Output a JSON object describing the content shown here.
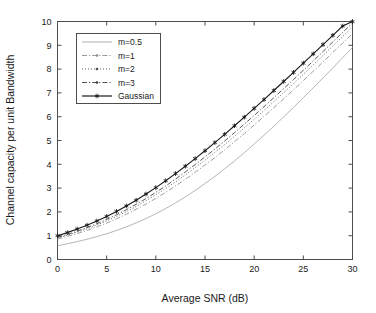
{
  "chart_data": {
    "type": "line",
    "title": "",
    "xlabel": "Average SNR (dB)",
    "ylabel": "Channel capacity per unit Bandwidth",
    "xlim": [
      0,
      30
    ],
    "ylim": [
      0,
      10
    ],
    "xticks": [
      0,
      5,
      10,
      15,
      20,
      25,
      30
    ],
    "yticks": [
      0,
      1,
      2,
      3,
      4,
      5,
      6,
      7,
      8,
      9,
      10
    ],
    "xtick_labels": [
      "0",
      "5",
      "10",
      "15",
      "20",
      "25",
      "30"
    ],
    "ytick_labels": [
      "0",
      "1",
      "2",
      "3",
      "4",
      "5",
      "6",
      "7",
      "8",
      "9",
      "10"
    ],
    "grid": false,
    "legend_position": "upper-left",
    "x": [
      0,
      1,
      2,
      3,
      4,
      5,
      6,
      7,
      8,
      9,
      10,
      11,
      12,
      13,
      14,
      15,
      16,
      17,
      18,
      19,
      20,
      21,
      22,
      23,
      24,
      25,
      26,
      27,
      28,
      29,
      30
    ],
    "series": [
      {
        "name": "m=0.5",
        "style": "solid",
        "color": "#a8a8a8",
        "marker": "none",
        "values": [
          0.58,
          0.66,
          0.75,
          0.85,
          0.96,
          1.08,
          1.22,
          1.37,
          1.54,
          1.72,
          1.92,
          2.14,
          2.38,
          2.63,
          2.9,
          3.19,
          3.49,
          3.81,
          4.14,
          4.49,
          4.85,
          5.22,
          5.6,
          5.99,
          6.39,
          6.8,
          7.21,
          7.63,
          8.05,
          8.48,
          8.91
        ]
      },
      {
        "name": "m=1",
        "style": "dashdot",
        "color": "#8c8c8c",
        "marker": "dot",
        "values": [
          0.86,
          0.97,
          1.09,
          1.22,
          1.37,
          1.53,
          1.71,
          1.9,
          2.11,
          2.33,
          2.57,
          2.82,
          3.09,
          3.37,
          3.66,
          3.97,
          4.28,
          4.61,
          4.95,
          5.29,
          5.65,
          6.01,
          6.38,
          6.75,
          7.13,
          7.52,
          7.91,
          8.3,
          8.7,
          9.09,
          9.49
        ]
      },
      {
        "name": "m=2",
        "style": "dotted",
        "color": "#4d4d4d",
        "marker": "dot",
        "values": [
          0.9,
          1.02,
          1.15,
          1.29,
          1.45,
          1.62,
          1.81,
          2.01,
          2.23,
          2.47,
          2.72,
          2.98,
          3.26,
          3.55,
          3.86,
          4.17,
          4.5,
          4.83,
          5.18,
          5.53,
          5.89,
          6.26,
          6.63,
          7.01,
          7.39,
          7.78,
          8.17,
          8.57,
          8.97,
          9.37,
          9.77
        ]
      },
      {
        "name": "m=3",
        "style": "dashdot",
        "color": "#3d3d3d",
        "marker": "dot",
        "values": [
          0.93,
          1.05,
          1.19,
          1.34,
          1.5,
          1.68,
          1.88,
          2.09,
          2.32,
          2.56,
          2.82,
          3.09,
          3.38,
          3.68,
          3.99,
          4.31,
          4.64,
          4.98,
          5.33,
          5.69,
          6.05,
          6.42,
          6.8,
          7.18,
          7.56,
          7.95,
          8.34,
          8.74,
          9.14,
          9.54,
          9.94
        ]
      },
      {
        "name": "Gaussian",
        "style": "solid",
        "color": "#1a1a1a",
        "marker": "star",
        "values": [
          1.0,
          1.13,
          1.28,
          1.44,
          1.62,
          1.81,
          2.02,
          2.25,
          2.49,
          2.75,
          3.02,
          3.31,
          3.61,
          3.92,
          4.24,
          4.57,
          4.91,
          5.26,
          5.62,
          5.98,
          6.35,
          6.72,
          7.1,
          7.48,
          7.86,
          8.25,
          8.64,
          9.03,
          9.42,
          9.81,
          10.0
        ]
      }
    ]
  },
  "legend": {
    "entries": [
      {
        "label": "m=0.5"
      },
      {
        "label": "m=1"
      },
      {
        "label": "m=2"
      },
      {
        "label": "m=3"
      },
      {
        "label": "Gaussian"
      }
    ]
  },
  "colors": {
    "axis": "#4d4d4d",
    "text": "#1a1a1a",
    "background": "#ffffff"
  }
}
